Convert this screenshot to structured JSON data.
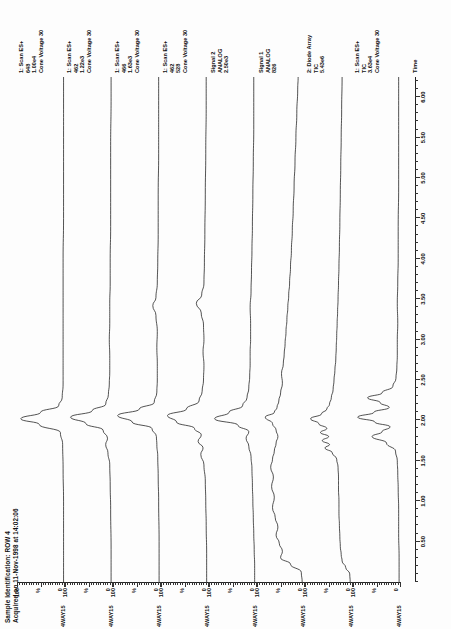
{
  "header": {
    "sample_id": "Sample Identification: ROW 4",
    "acquired": "Acquired on 11-Nov-1998 at 14:02:06"
  },
  "axes": {
    "y_top": "100",
    "y_mid": "%",
    "y_bottom": "0",
    "x_label": "Time",
    "x_ticks": [
      "0.50",
      "1.00",
      "1.50",
      "2.00",
      "2.50",
      "3.00",
      "3.50",
      "4.00",
      "4.50",
      "5.00",
      "5.50",
      "6.00"
    ],
    "x_min": 0.0,
    "x_max": 6.25
  },
  "file_name": "4WAY15",
  "traces": [
    {
      "file": "4WAY15",
      "line1": "1: Scan ES+",
      "line2": "648",
      "line3": "1.00e4",
      "line4": "Cone Voltage 30"
    },
    {
      "file": "4WAY15",
      "line1": "1: Scan ES+",
      "line2": "462",
      "line3": "1.22e3",
      "line4": "Cone Voltage 30"
    },
    {
      "file": "4WAY15",
      "line1": "1: Scan ES+",
      "line2": "466",
      "line3": "1.63e3",
      "line4": "Cone Voltage 30"
    },
    {
      "file": "4WAY15",
      "line1": "1: Scan ES+",
      "line2": "462",
      "line3": "528",
      "line4": "Cone Voltage 30"
    },
    {
      "file": "4WAY15",
      "line1": "Signal 2",
      "line2": "ANALOG",
      "line3": "2.50e3",
      "line4": ""
    },
    {
      "file": "4WAY15",
      "line1": "Signal 1",
      "line2": "ANALOG",
      "line3": "826",
      "line4": ""
    },
    {
      "file": "4WAY15",
      "line1": "2: Diode Array",
      "line2": "TIC",
      "line3": "5.43e6",
      "line4": ""
    },
    {
      "file": "4WAY15",
      "line1": "1: Scan ES+",
      "line2": "TIC",
      "line3": "3.63e4",
      "line4": "Cone Voltage 30"
    }
  ],
  "chart_data": {
    "type": "line",
    "title": "Sample Identification: ROW 4",
    "xlabel": "Time",
    "ylabel": "%",
    "xlim": [
      0.0,
      6.25
    ],
    "ylim": [
      0,
      100
    ],
    "grid": false,
    "legend_position": "right",
    "series": [
      {
        "name": "1: Scan ES+ 648 1.00e4",
        "points": [
          [
            0.0,
            1
          ],
          [
            0.6,
            1
          ],
          [
            1.0,
            1
          ],
          [
            1.4,
            2
          ],
          [
            1.7,
            3
          ],
          [
            1.85,
            8
          ],
          [
            1.95,
            55
          ],
          [
            2.02,
            96
          ],
          [
            2.1,
            52
          ],
          [
            2.18,
            12
          ],
          [
            2.28,
            4
          ],
          [
            2.45,
            2
          ],
          [
            2.6,
            2
          ],
          [
            2.8,
            2
          ],
          [
            3.0,
            2
          ],
          [
            3.2,
            2
          ],
          [
            3.4,
            2
          ],
          [
            3.7,
            2
          ],
          [
            4.0,
            2
          ],
          [
            4.5,
            1
          ],
          [
            5.0,
            1
          ],
          [
            5.5,
            1
          ],
          [
            6.0,
            1
          ],
          [
            6.25,
            1
          ]
        ]
      },
      {
        "name": "1: Scan ES+ 462 1.22e3",
        "points": [
          [
            0.0,
            2
          ],
          [
            0.4,
            2
          ],
          [
            0.9,
            3
          ],
          [
            1.2,
            4
          ],
          [
            1.45,
            5
          ],
          [
            1.6,
            9
          ],
          [
            1.7,
            14
          ],
          [
            1.78,
            10
          ],
          [
            1.88,
            20
          ],
          [
            1.96,
            58
          ],
          [
            2.04,
            92
          ],
          [
            2.12,
            44
          ],
          [
            2.2,
            14
          ],
          [
            2.32,
            8
          ],
          [
            2.45,
            6
          ],
          [
            2.6,
            5
          ],
          [
            2.8,
            5
          ],
          [
            3.0,
            6
          ],
          [
            3.2,
            5
          ],
          [
            3.45,
            5
          ],
          [
            3.7,
            4
          ],
          [
            4.0,
            4
          ],
          [
            4.4,
            3
          ],
          [
            4.9,
            3
          ],
          [
            5.4,
            3
          ],
          [
            6.0,
            2
          ],
          [
            6.25,
            2
          ]
        ]
      },
      {
        "name": "1: Scan ES+ 466 1.63e3",
        "points": [
          [
            0.0,
            2
          ],
          [
            0.5,
            2
          ],
          [
            1.0,
            3
          ],
          [
            1.3,
            4
          ],
          [
            1.55,
            5
          ],
          [
            1.7,
            7
          ],
          [
            1.8,
            8
          ],
          [
            1.9,
            18
          ],
          [
            1.98,
            62
          ],
          [
            2.06,
            94
          ],
          [
            2.14,
            46
          ],
          [
            2.22,
            13
          ],
          [
            2.35,
            7
          ],
          [
            2.5,
            6
          ],
          [
            2.7,
            6
          ],
          [
            2.9,
            7
          ],
          [
            3.1,
            6
          ],
          [
            3.3,
            9
          ],
          [
            3.42,
            16
          ],
          [
            3.52,
            9
          ],
          [
            3.7,
            6
          ],
          [
            3.95,
            5
          ],
          [
            4.3,
            4
          ],
          [
            4.8,
            4
          ],
          [
            5.3,
            3
          ],
          [
            5.9,
            3
          ],
          [
            6.25,
            3
          ]
        ]
      },
      {
        "name": "1: Scan ES+ 462 528",
        "points": [
          [
            0.0,
            3
          ],
          [
            0.35,
            3
          ],
          [
            0.7,
            4
          ],
          [
            1.0,
            5
          ],
          [
            1.25,
            6
          ],
          [
            1.45,
            9
          ],
          [
            1.58,
            16
          ],
          [
            1.66,
            11
          ],
          [
            1.74,
            22
          ],
          [
            1.82,
            15
          ],
          [
            1.9,
            30
          ],
          [
            1.98,
            70
          ],
          [
            2.06,
            90
          ],
          [
            2.14,
            48
          ],
          [
            2.24,
            20
          ],
          [
            2.36,
            13
          ],
          [
            2.5,
            10
          ],
          [
            2.68,
            9
          ],
          [
            2.85,
            11
          ],
          [
            3.0,
            9
          ],
          [
            3.18,
            10
          ],
          [
            3.33,
            15
          ],
          [
            3.45,
            26
          ],
          [
            3.55,
            14
          ],
          [
            3.7,
            9
          ],
          [
            3.95,
            8
          ],
          [
            4.3,
            7
          ],
          [
            4.8,
            6
          ],
          [
            5.3,
            5
          ],
          [
            5.9,
            4
          ],
          [
            6.25,
            4
          ]
        ]
      },
      {
        "name": "Signal 2 ANALOG 2.50e3",
        "points": [
          [
            0.0,
            3
          ],
          [
            0.2,
            3
          ],
          [
            0.4,
            4
          ],
          [
            0.6,
            5
          ],
          [
            0.8,
            6
          ],
          [
            1.0,
            7
          ],
          [
            1.2,
            8
          ],
          [
            1.4,
            9
          ],
          [
            1.55,
            11
          ],
          [
            1.68,
            16
          ],
          [
            1.78,
            22
          ],
          [
            1.86,
            16
          ],
          [
            1.94,
            40
          ],
          [
            2.02,
            92
          ],
          [
            2.1,
            60
          ],
          [
            2.18,
            30
          ],
          [
            2.28,
            20
          ],
          [
            2.4,
            16
          ],
          [
            2.55,
            14
          ],
          [
            2.7,
            13
          ],
          [
            2.85,
            13
          ],
          [
            3.0,
            12
          ],
          [
            3.2,
            12
          ],
          [
            3.4,
            13
          ],
          [
            3.6,
            11
          ],
          [
            3.85,
            10
          ],
          [
            4.1,
            9
          ],
          [
            4.4,
            8
          ],
          [
            4.8,
            7
          ],
          [
            5.2,
            6
          ],
          [
            5.6,
            5
          ],
          [
            6.0,
            5
          ],
          [
            6.25,
            5
          ]
        ]
      },
      {
        "name": "Signal 1 ANALOG 826",
        "points": [
          [
            0.0,
            4
          ],
          [
            0.12,
            6
          ],
          [
            0.22,
            30
          ],
          [
            0.3,
            52
          ],
          [
            0.38,
            48
          ],
          [
            0.48,
            55
          ],
          [
            0.58,
            62
          ],
          [
            0.68,
            58
          ],
          [
            0.8,
            64
          ],
          [
            0.92,
            70
          ],
          [
            1.05,
            66
          ],
          [
            1.18,
            72
          ],
          [
            1.3,
            68
          ],
          [
            1.42,
            74
          ],
          [
            1.52,
            70
          ],
          [
            1.62,
            66
          ],
          [
            1.72,
            62
          ],
          [
            1.8,
            58
          ],
          [
            1.88,
            62
          ],
          [
            1.96,
            70
          ],
          [
            2.04,
            86
          ],
          [
            2.1,
            66
          ],
          [
            2.16,
            60
          ],
          [
            2.24,
            56
          ],
          [
            2.34,
            52
          ],
          [
            2.46,
            48
          ],
          [
            2.58,
            50
          ],
          [
            2.7,
            46
          ],
          [
            2.82,
            44
          ],
          [
            2.95,
            42
          ],
          [
            3.1,
            40
          ],
          [
            3.25,
            38
          ],
          [
            3.4,
            36
          ],
          [
            3.55,
            34
          ],
          [
            3.7,
            32
          ],
          [
            3.9,
            30
          ],
          [
            4.1,
            28
          ],
          [
            4.35,
            26
          ],
          [
            4.6,
            24
          ],
          [
            4.9,
            22
          ],
          [
            5.2,
            20
          ],
          [
            5.5,
            18
          ],
          [
            5.8,
            16
          ],
          [
            6.1,
            14
          ],
          [
            6.25,
            13
          ]
        ]
      },
      {
        "name": "2: Diode Array TIC 5.43e6",
        "points": [
          [
            0.0,
            4
          ],
          [
            0.1,
            5
          ],
          [
            0.18,
            14
          ],
          [
            0.26,
            22
          ],
          [
            0.34,
            24
          ],
          [
            0.44,
            26
          ],
          [
            0.56,
            27
          ],
          [
            0.7,
            28
          ],
          [
            0.85,
            29
          ],
          [
            1.0,
            29
          ],
          [
            1.15,
            30
          ],
          [
            1.3,
            30
          ],
          [
            1.42,
            31
          ],
          [
            1.52,
            34
          ],
          [
            1.6,
            44
          ],
          [
            1.66,
            60
          ],
          [
            1.7,
            50
          ],
          [
            1.75,
            66
          ],
          [
            1.8,
            52
          ],
          [
            1.85,
            70
          ],
          [
            1.9,
            56
          ],
          [
            1.96,
            74
          ],
          [
            2.02,
            92
          ],
          [
            2.08,
            68
          ],
          [
            2.14,
            56
          ],
          [
            2.2,
            50
          ],
          [
            2.28,
            46
          ],
          [
            2.38,
            42
          ],
          [
            2.5,
            40
          ],
          [
            2.62,
            38
          ],
          [
            2.76,
            36
          ],
          [
            2.9,
            35
          ],
          [
            3.05,
            34
          ],
          [
            3.2,
            33
          ],
          [
            3.35,
            32
          ],
          [
            3.5,
            31
          ],
          [
            3.7,
            30
          ],
          [
            3.9,
            29
          ],
          [
            4.15,
            28
          ],
          [
            4.45,
            27
          ],
          [
            4.8,
            26
          ],
          [
            5.15,
            25
          ],
          [
            5.5,
            24
          ],
          [
            5.85,
            23
          ],
          [
            6.25,
            22
          ]
        ]
      },
      {
        "name": "1: Scan ES+ TIC 3.63e4",
        "points": [
          [
            0.0,
            2
          ],
          [
            0.3,
            2
          ],
          [
            0.6,
            3
          ],
          [
            0.9,
            3
          ],
          [
            1.15,
            4
          ],
          [
            1.35,
            5
          ],
          [
            1.5,
            6
          ],
          [
            1.62,
            10
          ],
          [
            1.72,
            30
          ],
          [
            1.8,
            62
          ],
          [
            1.86,
            40
          ],
          [
            1.92,
            22
          ],
          [
            1.98,
            56
          ],
          [
            2.04,
            94
          ],
          [
            2.1,
            58
          ],
          [
            2.16,
            24
          ],
          [
            2.22,
            44
          ],
          [
            2.28,
            72
          ],
          [
            2.34,
            40
          ],
          [
            2.42,
            16
          ],
          [
            2.52,
            9
          ],
          [
            2.65,
            7
          ],
          [
            2.8,
            6
          ],
          [
            3.0,
            6
          ],
          [
            3.2,
            5
          ],
          [
            3.45,
            6
          ],
          [
            3.7,
            5
          ],
          [
            4.0,
            4
          ],
          [
            4.4,
            4
          ],
          [
            4.9,
            3
          ],
          [
            5.4,
            3
          ],
          [
            5.9,
            3
          ],
          [
            6.25,
            3
          ]
        ]
      }
    ]
  }
}
